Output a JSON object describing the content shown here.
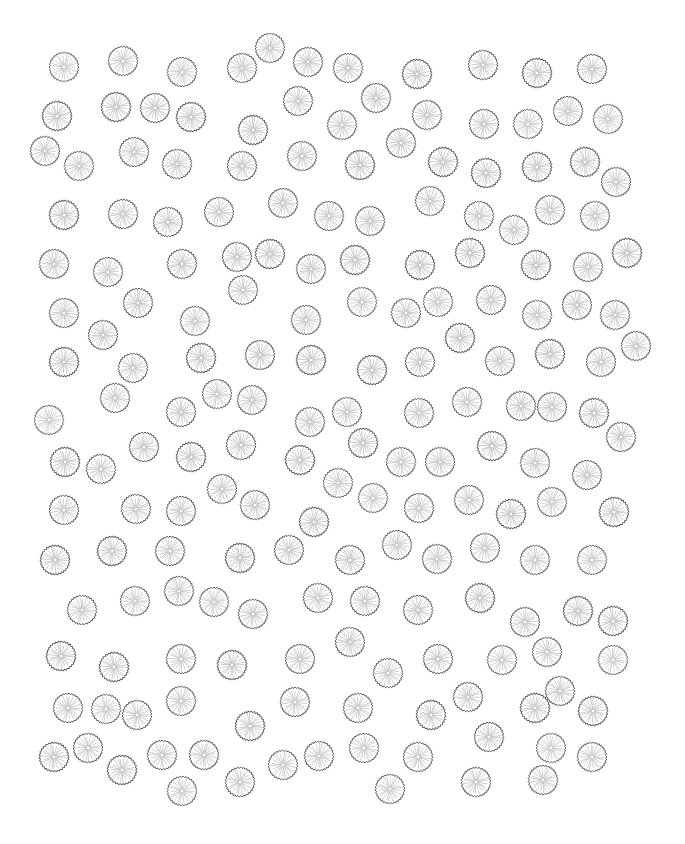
{
  "canvas": {
    "width": 685,
    "height": 844,
    "background": "#ffffff"
  },
  "symbol": {
    "icon": "tree-canopy-icon",
    "radius": 15,
    "outline_color": "#5a5a5a",
    "spoke_color": "#b4b4b4",
    "spokes": 22,
    "teeth": 30
  },
  "trees": [
    [
      64,
      67
    ],
    [
      123,
      61
    ],
    [
      182,
      72
    ],
    [
      242,
      68
    ],
    [
      270,
      48
    ],
    [
      308,
      62
    ],
    [
      348,
      68
    ],
    [
      417,
      74
    ],
    [
      483,
      65
    ],
    [
      537,
      73
    ],
    [
      592,
      69
    ],
    [
      57,
      116
    ],
    [
      116,
      107
    ],
    [
      155,
      108
    ],
    [
      191,
      117
    ],
    [
      298,
      101
    ],
    [
      253,
      130
    ],
    [
      342,
      125
    ],
    [
      376,
      98
    ],
    [
      427,
      115
    ],
    [
      484,
      124
    ],
    [
      528,
      124
    ],
    [
      568,
      111
    ],
    [
      608,
      119
    ],
    [
      45,
      151
    ],
    [
      79,
      166
    ],
    [
      134,
      152
    ],
    [
      177,
      164
    ],
    [
      242,
      166
    ],
    [
      302,
      156
    ],
    [
      360,
      165
    ],
    [
      401,
      143
    ],
    [
      443,
      162
    ],
    [
      486,
      173
    ],
    [
      537,
      167
    ],
    [
      585,
      162
    ],
    [
      616,
      182
    ],
    [
      64,
      215
    ],
    [
      123,
      214
    ],
    [
      168,
      222
    ],
    [
      219,
      212
    ],
    [
      283,
      203
    ],
    [
      329,
      216
    ],
    [
      370,
      221
    ],
    [
      430,
      201
    ],
    [
      479,
      216
    ],
    [
      514,
      230
    ],
    [
      550,
      210
    ],
    [
      595,
      216
    ],
    [
      54,
      264
    ],
    [
      108,
      272
    ],
    [
      182,
      264
    ],
    [
      237,
      257
    ],
    [
      270,
      254
    ],
    [
      311,
      269
    ],
    [
      355,
      260
    ],
    [
      420,
      265
    ],
    [
      470,
      253
    ],
    [
      536,
      265
    ],
    [
      588,
      267
    ],
    [
      627,
      253
    ],
    [
      64,
      313
    ],
    [
      138,
      303
    ],
    [
      243,
      290
    ],
    [
      103,
      335
    ],
    [
      195,
      321
    ],
    [
      306,
      320
    ],
    [
      362,
      302
    ],
    [
      406,
      313
    ],
    [
      438,
      302
    ],
    [
      491,
      300
    ],
    [
      537,
      315
    ],
    [
      577,
      305
    ],
    [
      615,
      315
    ],
    [
      64,
      362
    ],
    [
      133,
      368
    ],
    [
      201,
      358
    ],
    [
      260,
      355
    ],
    [
      311,
      360
    ],
    [
      372,
      370
    ],
    [
      420,
      362
    ],
    [
      460,
      338
    ],
    [
      500,
      361
    ],
    [
      550,
      354
    ],
    [
      601,
      362
    ],
    [
      636,
      346
    ],
    [
      115,
      398
    ],
    [
      181,
      412
    ],
    [
      217,
      394
    ],
    [
      252,
      400
    ],
    [
      49,
      420
    ],
    [
      310,
      422
    ],
    [
      347,
      412
    ],
    [
      419,
      413
    ],
    [
      467,
      402
    ],
    [
      521,
      406
    ],
    [
      552,
      407
    ],
    [
      594,
      413
    ],
    [
      144,
      447
    ],
    [
      191,
      457
    ],
    [
      241,
      445
    ],
    [
      363,
      443
    ],
    [
      492,
      446
    ],
    [
      621,
      437
    ],
    [
      65,
      462
    ],
    [
      101,
      469
    ],
    [
      300,
      460
    ],
    [
      401,
      462
    ],
    [
      440,
      462
    ],
    [
      535,
      463
    ],
    [
      587,
      475
    ],
    [
      338,
      483
    ],
    [
      222,
      489
    ],
    [
      373,
      498
    ],
    [
      469,
      500
    ],
    [
      552,
      502
    ],
    [
      64,
      510
    ],
    [
      136,
      509
    ],
    [
      181,
      511
    ],
    [
      255,
      505
    ],
    [
      314,
      522
    ],
    [
      419,
      508
    ],
    [
      511,
      514
    ],
    [
      614,
      512
    ],
    [
      55,
      560
    ],
    [
      112,
      551
    ],
    [
      170,
      551
    ],
    [
      240,
      558
    ],
    [
      289,
      550
    ],
    [
      350,
      560
    ],
    [
      397,
      545
    ],
    [
      437,
      559
    ],
    [
      485,
      548
    ],
    [
      535,
      560
    ],
    [
      592,
      560
    ],
    [
      82,
      610
    ],
    [
      135,
      601
    ],
    [
      179,
      591
    ],
    [
      214,
      602
    ],
    [
      253,
      614
    ],
    [
      318,
      598
    ],
    [
      365,
      601
    ],
    [
      418,
      610
    ],
    [
      480,
      598
    ],
    [
      525,
      622
    ],
    [
      578,
      611
    ],
    [
      613,
      621
    ],
    [
      61,
      656
    ],
    [
      114,
      667
    ],
    [
      181,
      659
    ],
    [
      232,
      665
    ],
    [
      300,
      659
    ],
    [
      350,
      642
    ],
    [
      388,
      673
    ],
    [
      438,
      659
    ],
    [
      502,
      660
    ],
    [
      547,
      652
    ],
    [
      613,
      660
    ],
    [
      68,
      708
    ],
    [
      106,
      709
    ],
    [
      137,
      715
    ],
    [
      181,
      701
    ],
    [
      295,
      702
    ],
    [
      358,
      708
    ],
    [
      431,
      715
    ],
    [
      468,
      697
    ],
    [
      535,
      708
    ],
    [
      560,
      691
    ],
    [
      593,
      711
    ],
    [
      250,
      726
    ],
    [
      489,
      737
    ],
    [
      54,
      757
    ],
    [
      88,
      748
    ],
    [
      122,
      770
    ],
    [
      162,
      755
    ],
    [
      204,
      755
    ],
    [
      283,
      765
    ],
    [
      319,
      756
    ],
    [
      364,
      748
    ],
    [
      418,
      757
    ],
    [
      551,
      748
    ],
    [
      592,
      757
    ],
    [
      182,
      791
    ],
    [
      240,
      782
    ],
    [
      390,
      789
    ],
    [
      476,
      782
    ],
    [
      543,
      780
    ]
  ]
}
